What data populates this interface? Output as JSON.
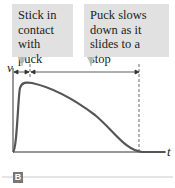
{
  "callouts": [
    {
      "text": "Stick in contact with puck"
    },
    {
      "text": "Puck slows down as it slides to a stop"
    }
  ],
  "axes": {
    "y_label": "v",
    "x_label": "t"
  },
  "figure_label": "B",
  "colors": {
    "callout_bg": "#e1e1e1",
    "curve": "#555555",
    "badge": "#777777"
  }
}
